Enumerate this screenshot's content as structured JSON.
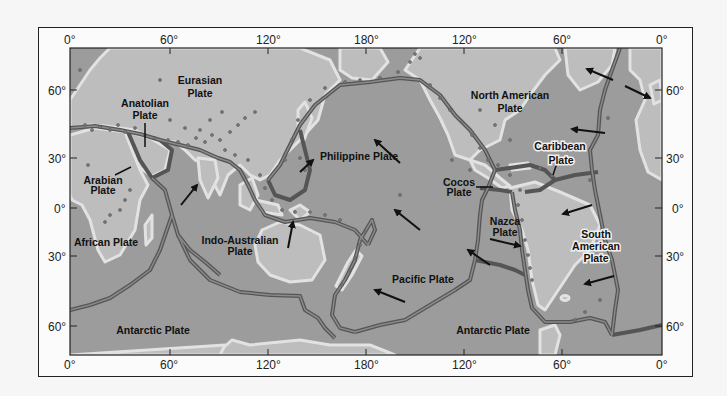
{
  "figure": {
    "colors": {
      "background": "#f6f6f6",
      "ocean": "#9c9c9c",
      "continent": "#bdbdbd",
      "coast_halo": "#e4e4e4",
      "plate_boundary": "#555555",
      "plate_boundary_inner": "#8a8a8a",
      "epicenter": "#6a6a6a",
      "arrow": "#111111",
      "frame": "#222222"
    }
  },
  "axes": {
    "top_ticks": [
      "0°",
      "60°",
      "120°",
      "180°",
      "120°",
      "60°",
      "0°"
    ],
    "bottom_ticks": [
      "0°",
      "60°",
      "120°",
      "180°",
      "120°",
      "60°",
      "0°"
    ],
    "left_ticks": [
      "60°",
      "30°",
      "0°",
      "30°",
      "60°"
    ],
    "right_ticks": [
      "60°",
      "30°",
      "0°",
      "30°",
      "60°"
    ]
  },
  "plates": [
    {
      "name": "Eurasian",
      "label_line1": "Eurasian",
      "label_line2": "Plate"
    },
    {
      "name": "Anatolian",
      "label_line1": "Anatolian",
      "label_line2": "Plate"
    },
    {
      "name": "Arabian",
      "label_line1": "Arabian",
      "label_line2": "Plate"
    },
    {
      "name": "African",
      "label_line1": "African Plate",
      "label_line2": ""
    },
    {
      "name": "Indo-Australian",
      "label_line1": "Indo-Australian",
      "label_line2": "Plate"
    },
    {
      "name": "Philippine",
      "label_line1": "Philippine Plate",
      "label_line2": ""
    },
    {
      "name": "Pacific",
      "label_line1": "Pacific Plate",
      "label_line2": ""
    },
    {
      "name": "North American",
      "label_line1": "North American",
      "label_line2": "Plate"
    },
    {
      "name": "Caribbean",
      "label_line1": "Caribbean",
      "label_line2": "Plate"
    },
    {
      "name": "Cocos",
      "label_line1": "Cocos",
      "label_line2": "Plate"
    },
    {
      "name": "Nazca",
      "label_line1": "Nazca",
      "label_line2": "Plate"
    },
    {
      "name": "South American",
      "label_line1": "South",
      "label_line2": "American",
      "label_line3": "Plate"
    },
    {
      "name": "Antarctic West",
      "label_line1": "Antarctic Plate",
      "label_line2": ""
    },
    {
      "name": "Antarctic East",
      "label_line1": "Antarctic Plate",
      "label_line2": ""
    }
  ]
}
